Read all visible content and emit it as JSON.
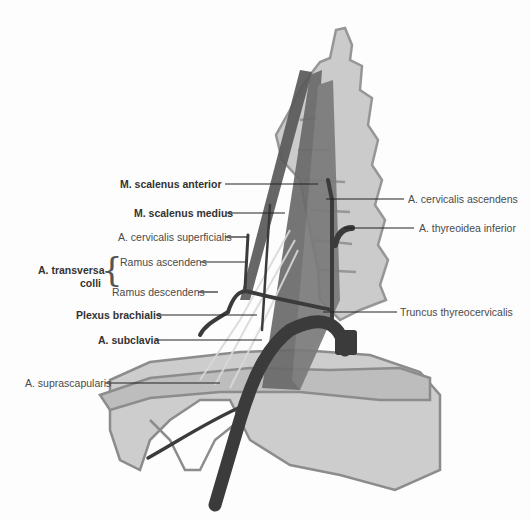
{
  "diagram": {
    "labels_left": [
      {
        "id": "scalenus-anterior",
        "text": "M. scalenus anterior",
        "bold": true
      },
      {
        "id": "scalenus-medius",
        "text": "M. scalenus medius",
        "bold": true
      },
      {
        "id": "cervicalis-superficialis",
        "text": "A. cervicalis superficialis",
        "bold": false
      },
      {
        "id": "ramus-ascendens",
        "text": "Ramus ascendens",
        "bold": false
      },
      {
        "id": "ramus-descendens",
        "text": "Ramus descendens",
        "bold": false
      },
      {
        "id": "plexus-brachialis",
        "text": "Plexus brachialis",
        "bold": true
      },
      {
        "id": "subclavia",
        "text": "A. subclavia",
        "bold": true
      },
      {
        "id": "suprascapularis",
        "text": "A. suprascapularis",
        "bold": false
      }
    ],
    "group_label": {
      "line1": "A. transversa",
      "line2": "colli"
    },
    "labels_right": [
      {
        "id": "cervicalis-ascendens",
        "text": "A. cervicalis ascendens",
        "bold": false
      },
      {
        "id": "thyreoidea-inferior",
        "text": "A. thyreoidea inferior",
        "bold": false
      },
      {
        "id": "truncus-thyreocervicalis",
        "text": "Truncus thyreocervicalis",
        "bold": false
      }
    ],
    "colors": {
      "bone_fill": "#c9c9c9",
      "bone_stroke": "#8f8f8f",
      "muscle": "#6e6e6e",
      "artery": "#3a3a3a",
      "leader": "#222222",
      "text": "#4a4a4a"
    }
  }
}
